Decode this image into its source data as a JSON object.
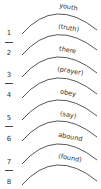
{
  "diagram": {
    "type": "word-arc-worksheet",
    "arc_color": "#444444",
    "text_color": "#333333",
    "numbers": [
      "1",
      "2",
      "3",
      "4",
      "5",
      "6",
      "7",
      "8"
    ],
    "arcs": [
      {
        "label": "youth"
      },
      {
        "label": "(truth)"
      },
      {
        "label": "there"
      },
      {
        "label": "(prayer)"
      },
      {
        "label": "obey"
      },
      {
        "label": "(say)"
      },
      {
        "label": "abound"
      },
      {
        "label": "(found)"
      }
    ]
  }
}
